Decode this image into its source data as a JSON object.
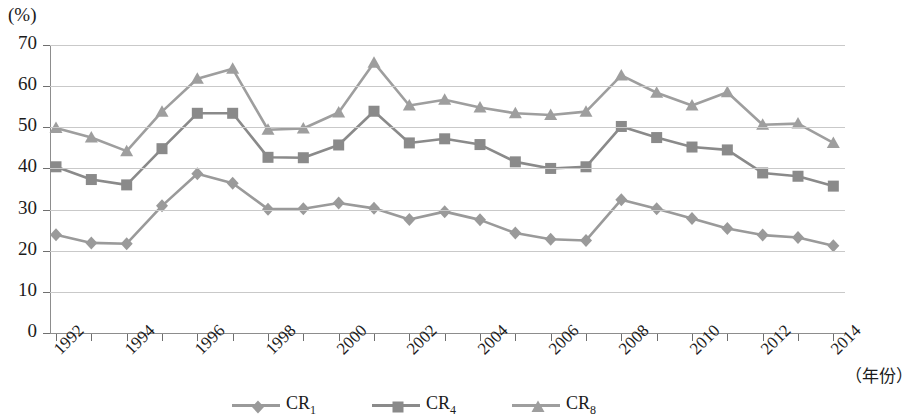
{
  "chart_data": {
    "type": "line",
    "title": "",
    "xlabel": "（年份）",
    "ylabel": "(%)",
    "unit_label": "(%)",
    "ylim": [
      0,
      70
    ],
    "ytick_values": [
      0,
      10,
      20,
      30,
      40,
      50,
      60,
      70
    ],
    "ytick_labels": [
      "0",
      "10",
      "20",
      "30",
      "40",
      "50",
      "60",
      "70"
    ],
    "grid": true,
    "legend_position": "bottom",
    "x": [
      1992,
      1993,
      1994,
      1995,
      1996,
      1997,
      1998,
      1999,
      2000,
      2001,
      2002,
      2003,
      2004,
      2005,
      2006,
      2007,
      2008,
      2009,
      2010,
      2011,
      2012,
      2013,
      2014
    ],
    "xtick_labels": [
      "1992",
      "1994",
      "1996",
      "1998",
      "2000",
      "2002",
      "2004",
      "2006",
      "2008",
      "2010",
      "2012",
      "2014"
    ],
    "xtick_years": [
      1992,
      1994,
      1996,
      1998,
      2000,
      2002,
      2004,
      2006,
      2008,
      2010,
      2012,
      2014
    ],
    "series": [
      {
        "name": "CR1",
        "label": "CR",
        "subscript": "1",
        "marker": "diamond",
        "color": "#9a9a9a",
        "values": [
          23.9,
          21.9,
          21.7,
          30.9,
          38.7,
          36.4,
          30.1,
          30.2,
          31.6,
          30.3,
          27.6,
          29.5,
          27.5,
          24.3,
          22.8,
          22.5,
          32.4,
          30.2,
          27.8,
          25.4,
          23.8,
          23.2,
          21.2
        ]
      },
      {
        "name": "CR4",
        "label": "CR",
        "subscript": "4",
        "marker": "square",
        "color": "#8a8a8a",
        "values": [
          40.4,
          37.3,
          36.0,
          44.8,
          53.4,
          53.4,
          42.7,
          42.6,
          45.7,
          53.9,
          46.2,
          47.2,
          45.8,
          41.6,
          40.0,
          40.4,
          50.2,
          47.5,
          45.2,
          44.5,
          38.9,
          38.1,
          35.7
        ]
      },
      {
        "name": "CR8",
        "label": "CR",
        "subscript": "8",
        "marker": "triangle",
        "color": "#9e9e9e",
        "values": [
          49.8,
          47.5,
          44.2,
          53.8,
          61.8,
          64.2,
          49.4,
          49.7,
          53.6,
          65.7,
          55.3,
          56.7,
          54.8,
          53.4,
          53.0,
          53.8,
          62.6,
          58.4,
          55.3,
          58.5,
          50.6,
          50.9,
          46.2
        ]
      }
    ]
  },
  "legend": {
    "entries": [
      {
        "label": "CR",
        "subscript": "1"
      },
      {
        "label": "CR",
        "subscript": "4"
      },
      {
        "label": "CR",
        "subscript": "8"
      }
    ]
  }
}
